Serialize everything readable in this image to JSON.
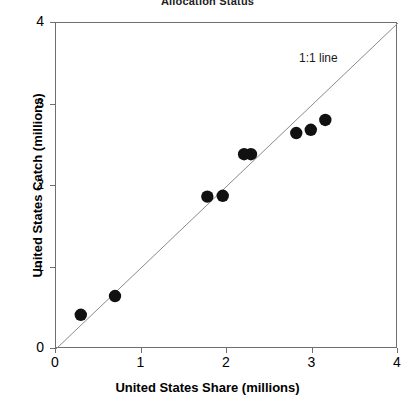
{
  "chart_data": {
    "type": "scatter",
    "title": "Allocation Status",
    "xlabel": "United States Share (millions)",
    "ylabel": "United States Catch (millions)",
    "xlim": [
      0,
      4
    ],
    "ylim": [
      0,
      4
    ],
    "xticks": [
      "0",
      "1",
      "2",
      "3",
      "4"
    ],
    "yticks": [
      "0",
      "1",
      "2",
      "3",
      "4"
    ],
    "xtick_values": [
      0,
      1,
      2,
      3,
      4
    ],
    "ytick_values": [
      0,
      1,
      2,
      3,
      4
    ],
    "grid": false,
    "legend": null,
    "marker_color": "#111111",
    "refline_color": "#8a8a8a",
    "annotations": [
      {
        "text": "1:1 line",
        "x": 2.86,
        "y": 3.55
      }
    ],
    "reference_line": {
      "label": "1:1 line",
      "from": [
        0,
        0
      ],
      "to": [
        4,
        4
      ]
    },
    "points": [
      {
        "x": 0.29,
        "y": 0.42
      },
      {
        "x": 0.69,
        "y": 0.65
      },
      {
        "x": 1.77,
        "y": 1.87
      },
      {
        "x": 1.95,
        "y": 1.88
      },
      {
        "x": 2.2,
        "y": 2.39
      },
      {
        "x": 2.28,
        "y": 2.39
      },
      {
        "x": 2.81,
        "y": 2.65
      },
      {
        "x": 2.98,
        "y": 2.69
      },
      {
        "x": 3.15,
        "y": 2.81
      }
    ]
  }
}
